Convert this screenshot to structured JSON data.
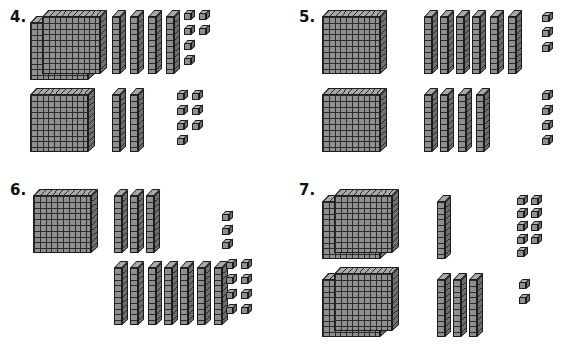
{
  "worksheet": {
    "title": "Base-Ten Blocks Addition Worksheet",
    "background_color": "#ffffff",
    "block_colors": {
      "face": "#8f8f8f",
      "top": "#a8a8a8",
      "side": "#6e6e6e",
      "outline": "#1c1c1c"
    },
    "block_values": {
      "flat": 100,
      "rod": 10,
      "unit": 1
    }
  },
  "problems": [
    {
      "id": "problem-4",
      "number": "4.",
      "addends": [
        {
          "label": "top-addend",
          "flats": 2,
          "rods": 4,
          "units": 6,
          "value": 246,
          "unit_layout": [
            2,
            2,
            1,
            1
          ]
        },
        {
          "label": "bottom-addend",
          "flats": 1,
          "rods": 2,
          "units": 7,
          "value": 127,
          "unit_layout": [
            2,
            2,
            2,
            1
          ]
        }
      ]
    },
    {
      "id": "problem-5",
      "number": "5.",
      "addends": [
        {
          "label": "top-addend",
          "flats": 1,
          "rods": 6,
          "units": 3,
          "value": 163,
          "unit_layout": [
            1,
            1,
            1
          ]
        },
        {
          "label": "bottom-addend",
          "flats": 1,
          "rods": 4,
          "units": 4,
          "value": 144,
          "unit_layout": [
            1,
            1,
            1,
            1
          ]
        }
      ]
    },
    {
      "id": "problem-6",
      "number": "6.",
      "addends": [
        {
          "label": "top-addend",
          "flats": 1,
          "rods": 3,
          "units": 3,
          "value": 133,
          "unit_layout": [
            1,
            1,
            1
          ]
        },
        {
          "label": "bottom-addend",
          "flats": 0,
          "rods": 7,
          "units": 8,
          "value": 78,
          "unit_layout": [
            2,
            2,
            2,
            2
          ]
        }
      ]
    },
    {
      "id": "problem-7",
      "number": "7.",
      "addends": [
        {
          "label": "top-addend",
          "flats": 2,
          "rods": 1,
          "units": 9,
          "value": 219,
          "unit_layout": [
            2,
            2,
            2,
            2,
            1
          ]
        },
        {
          "label": "bottom-addend",
          "flats": 2,
          "rods": 3,
          "units": 2,
          "value": 232,
          "unit_layout": [
            1,
            1
          ]
        }
      ]
    }
  ]
}
